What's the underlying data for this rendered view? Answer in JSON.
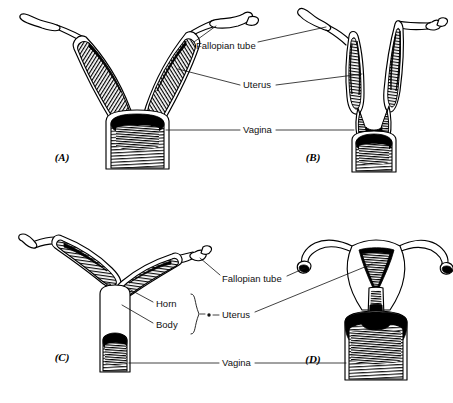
{
  "figure": {
    "background_color": "#ffffff",
    "ink_color": "#000000",
    "style": "black-and-white engraved line drawing with cross-hatch shading"
  },
  "panels": [
    {
      "id": "A",
      "letter": "(A)",
      "letter_x": 62,
      "letter_y": 158,
      "description": "Duplex uterus with two long separate horns forming a wide V above a single large vagina"
    },
    {
      "id": "B",
      "letter": "(B)",
      "letter_x": 313,
      "letter_y": 158,
      "description": "Bipartite uterus with two shorter horns fused low over a broad vagina"
    },
    {
      "id": "C",
      "letter": "(C)",
      "letter_x": 62,
      "letter_y": 358,
      "description": "Bicornuate uterus with long horizontal horns, a short body and a narrow vagina"
    },
    {
      "id": "D",
      "letter": "(D)",
      "letter_x": 313,
      "letter_y": 360,
      "description": "Simplex uterus with a single triangular cavity, no horns, and slender fallopian tubes"
    }
  ],
  "labels_top": [
    {
      "name": "fallopian-tube",
      "text": "Fallopian tube",
      "x": 196,
      "y": 46
    },
    {
      "name": "uterus",
      "text": "Uterus",
      "x": 243,
      "y": 85
    },
    {
      "name": "vagina",
      "text": "Vagina",
      "x": 243,
      "y": 130
    }
  ],
  "labels_bottom": [
    {
      "name": "fallopian-tube",
      "text": "Fallopian tube",
      "x": 222,
      "y": 279
    },
    {
      "name": "horn",
      "text": "Horn",
      "x": 156,
      "y": 304
    },
    {
      "name": "body",
      "text": "Body",
      "x": 156,
      "y": 325
    },
    {
      "name": "uterus",
      "text": "Uterus",
      "x": 222,
      "y": 315
    },
    {
      "name": "vagina",
      "text": "Vagina",
      "x": 222,
      "y": 363
    }
  ],
  "annotations": {
    "brace_groups": "Horn and Body are grouped by a right-facing curly brace that connects through a small dot to the Uterus label",
    "leader_style": "thin straight leader lines from each label to the corresponding structure in the adjacent panels"
  }
}
